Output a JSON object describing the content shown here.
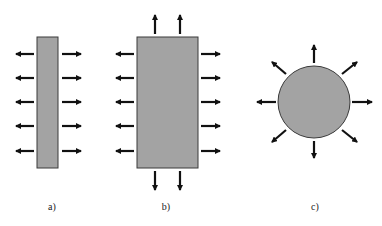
{
  "colors": {
    "fill": "#a3a3a3",
    "stroke": "#3a3a3a",
    "arrow": "#111111"
  },
  "panels": [
    {
      "id": "a",
      "label": "a)",
      "shape": "thin-rectangle",
      "arrows": "left-right"
    },
    {
      "id": "b",
      "label": "b)",
      "shape": "wide-rectangle",
      "arrows": "all-sides"
    },
    {
      "id": "c",
      "label": "c)",
      "shape": "circle",
      "arrows": "radial-8"
    }
  ]
}
